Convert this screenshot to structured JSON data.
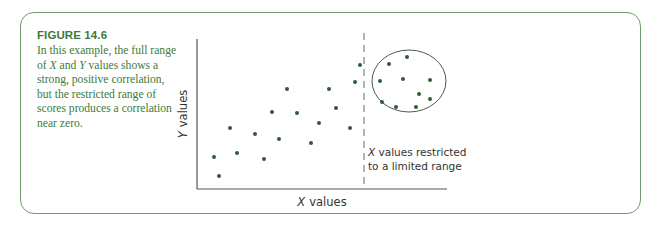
{
  "figure": {
    "title": "FIGURE 14.6",
    "caption_parts": [
      "In this example, the full range of ",
      "X",
      " and ",
      "Y",
      " values shows a strong, positive correlation, but the restricted range of scores produces a correlation near zero."
    ]
  },
  "colors": {
    "frame": "#6f9a6a",
    "caption_text": "#3d7a3a",
    "dots": "#2f5e2f",
    "axes": "#444444"
  },
  "chart_data": {
    "type": "scatter",
    "title": "",
    "xlabel_var": "X",
    "xlabel": "values",
    "ylabel_var": "Y",
    "ylabel": "values",
    "grid": false,
    "axis_ticks": false,
    "annotation": {
      "var": "X",
      "line1": " values restricted",
      "line2": "to a limited range"
    },
    "points_full_range": [
      {
        "x": 219,
        "y": 176
      },
      {
        "x": 214,
        "y": 157
      },
      {
        "x": 230,
        "y": 128
      },
      {
        "x": 237,
        "y": 153
      },
      {
        "x": 255,
        "y": 134
      },
      {
        "x": 264,
        "y": 159
      },
      {
        "x": 272,
        "y": 112
      },
      {
        "x": 279,
        "y": 139
      },
      {
        "x": 287,
        "y": 89
      },
      {
        "x": 297,
        "y": 113
      },
      {
        "x": 311,
        "y": 143
      },
      {
        "x": 319,
        "y": 123
      },
      {
        "x": 329,
        "y": 89
      },
      {
        "x": 336,
        "y": 108
      },
      {
        "x": 350,
        "y": 128
      },
      {
        "x": 355,
        "y": 82
      },
      {
        "x": 360,
        "y": 65
      }
    ],
    "points_restricted_range": [
      {
        "x": 407,
        "y": 57
      },
      {
        "x": 389,
        "y": 64
      },
      {
        "x": 380,
        "y": 81
      },
      {
        "x": 403,
        "y": 79
      },
      {
        "x": 430,
        "y": 80
      },
      {
        "x": 419,
        "y": 94
      },
      {
        "x": 430,
        "y": 99
      },
      {
        "x": 382,
        "y": 102
      },
      {
        "x": 396,
        "y": 107
      },
      {
        "x": 416,
        "y": 107
      }
    ],
    "restriction_cutoff_x": 364,
    "restricted_circle": {
      "cx": 409,
      "cy": 81,
      "rx": 37,
      "ry": 31
    }
  }
}
